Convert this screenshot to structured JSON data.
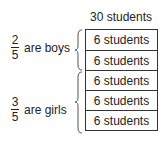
{
  "total_label": "30 students",
  "rows": [
    "6 students",
    "6 students",
    "6 students",
    "6 students",
    "6 students"
  ],
  "groups": [
    {
      "numerator": "2",
      "denominator": "5",
      "text": "are boys",
      "rows": 2
    },
    {
      "numerator": "3",
      "denominator": "5",
      "text": "are girls",
      "rows": 3
    }
  ]
}
